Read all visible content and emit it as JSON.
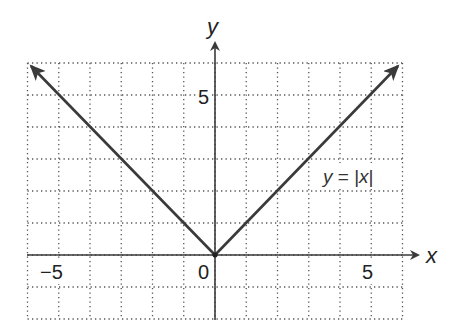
{
  "chart_data": {
    "type": "line",
    "title": "",
    "xlabel": "x",
    "ylabel": "y",
    "xlim": [
      -6,
      6
    ],
    "ylim": [
      -2,
      6
    ],
    "grid": true,
    "grid_style": "dotted",
    "x_ticks_labeled": [
      {
        "value": -5,
        "label": "−5"
      },
      {
        "value": 0,
        "label": "0"
      },
      {
        "value": 5,
        "label": "5"
      }
    ],
    "y_ticks_labeled": [
      {
        "value": 5,
        "label": "5"
      }
    ],
    "series": [
      {
        "name": "y = |x|",
        "x": [
          -6,
          -5,
          -4,
          -3,
          -2,
          -1,
          0,
          1,
          2,
          3,
          4,
          5,
          6
        ],
        "y": [
          6,
          5,
          4,
          3,
          2,
          1,
          0,
          1,
          2,
          3,
          4,
          5,
          6
        ],
        "arrows_at_ends": true
      }
    ],
    "annotations": [
      {
        "text": "y = |x|",
        "x": 4,
        "y": 2.4
      }
    ],
    "colors": {
      "line": "#3a3a3a",
      "axis": "#3a3a3a",
      "grid": "#555555",
      "text": "#222222"
    }
  },
  "labels": {
    "x_axis": "x",
    "y_axis": "y",
    "tick_neg5": "−5",
    "tick_0": "0",
    "tick_5_x": "5",
    "tick_5_y": "5",
    "equation_y": "y",
    "equation_eq": " = |",
    "equation_x": "x",
    "equation_close": "|"
  }
}
